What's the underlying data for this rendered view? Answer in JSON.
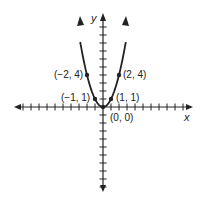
{
  "chart_data": {
    "type": "line",
    "title": "",
    "xlabel": "x",
    "ylabel": "y",
    "function": "y = x^2",
    "xlim": [
      -11,
      11
    ],
    "ylim": [
      -10.5,
      11.5
    ],
    "grid": false,
    "tick_step": 1,
    "series": [
      {
        "name": "y = x^2",
        "x": [
          -2.9,
          -2,
          -1,
          0,
          1,
          2,
          2.9
        ],
        "y": [
          8.41,
          4,
          1,
          0,
          1,
          4,
          8.41
        ]
      }
    ],
    "annotations": [
      {
        "label": "(−2, 4)",
        "x": -2,
        "y": 4
      },
      {
        "label": "(2, 4)",
        "x": 2,
        "y": 4
      },
      {
        "label": "(−1, 1)",
        "x": -1,
        "y": 1
      },
      {
        "label": "(1, 1)",
        "x": 1,
        "y": 1
      },
      {
        "label": "(0, 0)",
        "x": 0,
        "y": 0
      }
    ]
  },
  "labels": {
    "x_axis": "x",
    "y_axis": "y",
    "p_neg2_4": "(−2, 4)",
    "p_2_4": "(2, 4)",
    "p_neg1_1": "(−1, 1)",
    "p_1_1": "(1, 1)",
    "p_0_0": "(0, 0)"
  },
  "colors": {
    "ink": "#222222",
    "background": "#ffffff"
  }
}
